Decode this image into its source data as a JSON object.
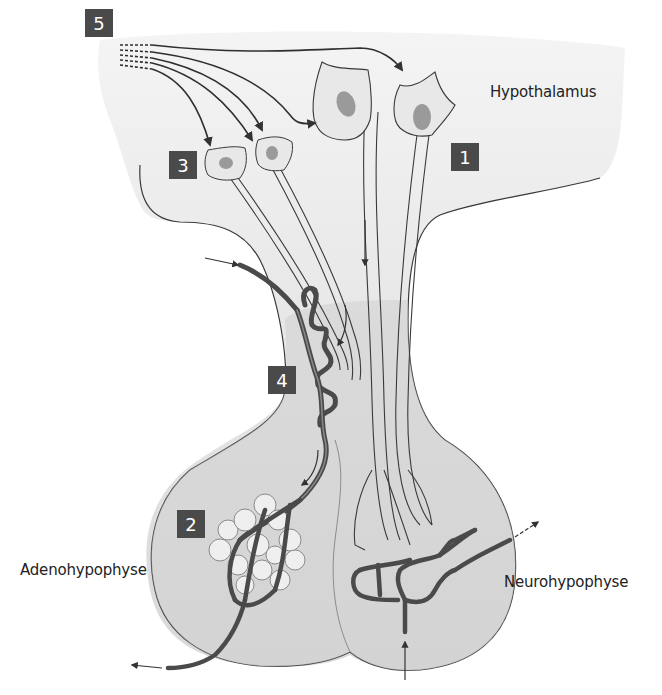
{
  "diagram": {
    "type": "anatomical-illustration",
    "regions": {
      "hypothalamus": "Hypothalamus",
      "adenohypophyse": "Adenohypophyse",
      "neurohypophyse": "Neurohypophyse"
    },
    "markers": [
      {
        "id": "1",
        "label": "1"
      },
      {
        "id": "2",
        "label": "2"
      },
      {
        "id": "3",
        "label": "3"
      },
      {
        "id": "4",
        "label": "4"
      },
      {
        "id": "5",
        "label": "5"
      }
    ],
    "colors": {
      "tissue_fill": "#d6d6d6",
      "tissue_light": "#ececec",
      "outline": "#3a3a3a",
      "vessel": "#5a5a5a",
      "nucleus": "#9a9a9a",
      "badge": "#4a4a4a",
      "cell_fill": "#efefef"
    }
  }
}
